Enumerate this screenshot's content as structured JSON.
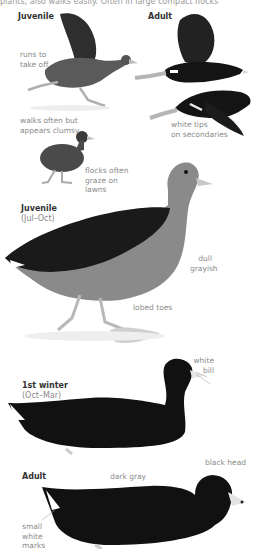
{
  "page": {
    "cut_text": "plants; also walks easily. Often in large compact flocks"
  },
  "sections": {
    "flight": {
      "juvenile_header": "Juvenile",
      "adult_header": "Adult",
      "labels": {
        "runs": [
          "runs to",
          "take off"
        ],
        "white_tips": [
          "white tips",
          "on secondaries"
        ],
        "walks": [
          "walks often but",
          "appears clumsy"
        ],
        "flocks": [
          "flocks often",
          "graze on",
          "lawns"
        ]
      }
    },
    "juvenile_standing": {
      "header": "Juvenile",
      "season": "(Jul–Oct)",
      "labels": {
        "dull": [
          "dull",
          "grayish"
        ],
        "lobed": "lobed toes"
      }
    },
    "first_winter": {
      "header": "1st winter",
      "season": "(Oct–Mar)",
      "labels": {
        "white_bill": [
          "white",
          "bill"
        ]
      }
    },
    "adult_swimming": {
      "header": "Adult",
      "labels": {
        "black_head": "black head",
        "dark_gray": "dark gray",
        "small_white": [
          "small",
          "white",
          "marks"
        ]
      }
    }
  },
  "colors": {
    "black_plumage": "#141414",
    "juvenile_gray": "#6a6a6a",
    "legs": "#b9b9b9",
    "label_text": "#8a8a8a",
    "header_text": "#333333"
  }
}
